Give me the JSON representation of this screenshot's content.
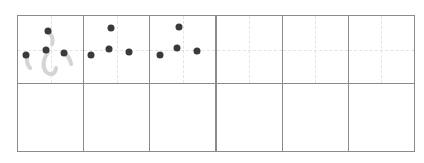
{
  "worksheet": {
    "type": "hiragana-writing-practice",
    "character": "ふ",
    "columns": 6,
    "rows": 2,
    "colors": {
      "grid_line": "#8a8a8a",
      "guide_line": "#e3e3e3",
      "dot": "#3a3a3a",
      "trace_stroke": "#d4d4d4"
    },
    "cells": [
      {
        "row": 0,
        "col": 0,
        "content": "trace-character-with-dots",
        "dots": [
          [
            0.45,
            0.22
          ],
          [
            0.42,
            0.5
          ],
          [
            0.7,
            0.55
          ],
          [
            0.12,
            0.58
          ]
        ]
      },
      {
        "row": 0,
        "col": 1,
        "content": "dots-only",
        "dots": [
          [
            0.4,
            0.18
          ],
          [
            0.38,
            0.48
          ],
          [
            0.68,
            0.53
          ],
          [
            0.1,
            0.58
          ]
        ]
      },
      {
        "row": 0,
        "col": 2,
        "content": "dots-only",
        "dots": [
          [
            0.43,
            0.16
          ],
          [
            0.4,
            0.47
          ],
          [
            0.7,
            0.52
          ],
          [
            0.14,
            0.58
          ]
        ]
      },
      {
        "row": 0,
        "col": 3,
        "content": "empty-guided"
      },
      {
        "row": 0,
        "col": 4,
        "content": "empty-guided"
      },
      {
        "row": 0,
        "col": 5,
        "content": "empty-guided"
      },
      {
        "row": 1,
        "col": 0,
        "content": "empty"
      },
      {
        "row": 1,
        "col": 1,
        "content": "empty"
      },
      {
        "row": 1,
        "col": 2,
        "content": "empty"
      },
      {
        "row": 1,
        "col": 3,
        "content": "empty"
      },
      {
        "row": 1,
        "col": 4,
        "content": "empty"
      },
      {
        "row": 1,
        "col": 5,
        "content": "empty"
      }
    ]
  }
}
